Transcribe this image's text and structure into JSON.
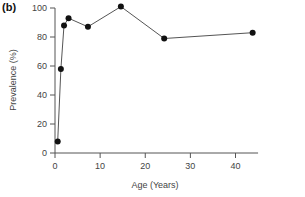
{
  "chart_data": {
    "type": "line",
    "panel_label": "(b)",
    "title": "",
    "xlabel": "Age (Years)",
    "ylabel": "Prevalence (%)",
    "xlim": [
      0,
      45
    ],
    "ylim": [
      0,
      100
    ],
    "xticks": [
      0,
      10,
      20,
      30,
      40
    ],
    "yticks": [
      0,
      20,
      40,
      60,
      80,
      100
    ],
    "grid": false,
    "legend": null,
    "series": [
      {
        "name": "Prevalence",
        "marker": "filled-circle",
        "color": "#111111",
        "x": [
          0.6,
          1.3,
          2.0,
          3.0,
          7.3,
          14.6,
          24.2,
          43.8
        ],
        "y": [
          8,
          58,
          88,
          93,
          87,
          101,
          79,
          83
        ]
      }
    ]
  }
}
